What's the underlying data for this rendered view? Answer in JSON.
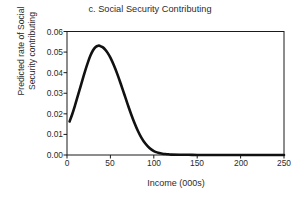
{
  "chart_data": {
    "type": "line",
    "title": "c. Social Security Contributing",
    "xlabel": "Income (000s)",
    "ylabel": "Predicted rate of Social Security contributing",
    "ylabel_lines": [
      "Predicted rate of Social",
      "Security contributing"
    ],
    "xlim": [
      0,
      250
    ],
    "ylim": [
      0.0,
      0.06
    ],
    "xticks": [
      0,
      50,
      100,
      150,
      200,
      250
    ],
    "xtick_labels": [
      "0",
      "50",
      "100",
      "150",
      "200",
      "250"
    ],
    "yticks": [
      0.0,
      0.01,
      0.02,
      0.03,
      0.04,
      0.05,
      0.06
    ],
    "ytick_labels": [
      "0.00",
      "0.01",
      "0.02",
      "0.03",
      "0.04",
      "0.05",
      "0.06"
    ],
    "grid": false,
    "legend": null,
    "series": [
      {
        "name": "Predicted rate of Social Security contributing",
        "color": "#111111",
        "line_width": 2.6,
        "x": [
          3,
          6,
          9,
          12,
          15,
          18,
          21,
          24,
          27,
          30,
          33,
          36,
          38,
          41,
          44,
          47,
          50,
          54,
          58,
          62,
          66,
          70,
          74,
          78,
          82,
          86,
          90,
          95,
          100,
          105,
          110,
          115,
          120,
          130,
          140,
          150,
          165,
          180,
          200,
          220,
          250
        ],
        "y": [
          0.0163,
          0.0198,
          0.0238,
          0.0281,
          0.0324,
          0.0367,
          0.041,
          0.0449,
          0.0483,
          0.0509,
          0.0525,
          0.0531,
          0.053,
          0.0524,
          0.0512,
          0.0495,
          0.0473,
          0.0436,
          0.0393,
          0.0345,
          0.0295,
          0.0245,
          0.0197,
          0.0153,
          0.0114,
          0.0082,
          0.0057,
          0.0034,
          0.0019,
          0.0011,
          0.0006,
          0.0004,
          0.0002,
          0.0001,
          0.0001,
          0.0,
          0.0,
          0.0,
          0.0,
          0.0,
          0.0
        ]
      }
    ],
    "peak": {
      "x": 37,
      "y": 0.053
    }
  },
  "axes": {
    "frame_color": "#1a1a1a",
    "tick_color": "#1a1a1a"
  },
  "figure": {
    "background": "#ffffff"
  }
}
